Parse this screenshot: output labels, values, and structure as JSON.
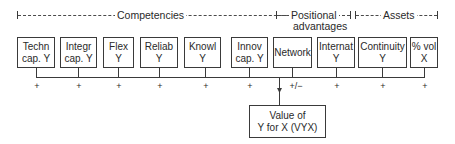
{
  "groups": [
    {
      "label": "Competencies"
    },
    {
      "label_line1": "Positional",
      "label_line2": "advantages"
    },
    {
      "label": "Assets"
    }
  ],
  "factors": [
    {
      "line1": "Techn",
      "line2": "cap. Y",
      "sign": "+"
    },
    {
      "line1": "Integr",
      "line2": "cap. Y",
      "sign": "+"
    },
    {
      "line1": "Flex",
      "line2": "Y",
      "sign": "+"
    },
    {
      "line1": "Reliab",
      "line2": "Y",
      "sign": "+"
    },
    {
      "line1": "Knowl",
      "line2": "Y",
      "sign": "+"
    },
    {
      "line1": "Innov",
      "line2": "cap. Y",
      "sign": "+"
    },
    {
      "line1": "Network",
      "line2": "",
      "sign": "+/−"
    },
    {
      "line1": "Internat",
      "line2": "Y",
      "sign": "+"
    },
    {
      "line1": "Continuity",
      "line2": "Y",
      "sign": "+"
    },
    {
      "line1": "% vol",
      "line2": "X",
      "sign": "+"
    }
  ],
  "outcome": {
    "line1": "Value of",
    "line2": "Y for X (VYX)"
  },
  "colors": {
    "line": "#3a3a3a",
    "text": "#2a2a2a",
    "background": "#ffffff"
  }
}
